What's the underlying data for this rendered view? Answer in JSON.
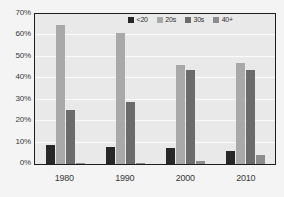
{
  "chart_data": {
    "type": "bar",
    "title": "",
    "subtitle": "",
    "xlabel": "",
    "ylabel": "",
    "categories": [
      "1980",
      "1990",
      "2000",
      "2010"
    ],
    "series": [
      {
        "name": "<20",
        "color": "#272727",
        "values": [
          9,
          8,
          7.5,
          6
        ]
      },
      {
        "name": "20s",
        "color": "#a9a9a9",
        "values": [
          65,
          61,
          46,
          47
        ]
      },
      {
        "name": "30s",
        "color": "#6b6b6b",
        "values": [
          25,
          29,
          44,
          44
        ]
      },
      {
        "name": "40+",
        "color": "#8d8d8d",
        "values": [
          0.5,
          0.5,
          1.5,
          4
        ]
      }
    ],
    "ylim": [
      0,
      70
    ],
    "yticks": [
      0,
      10,
      20,
      30,
      40,
      50,
      60,
      70
    ],
    "ytick_labels": [
      "0%",
      "10%",
      "20%",
      "30%",
      "40%",
      "50%",
      "60%",
      "70%"
    ],
    "grid": true,
    "legend_position": "top-right",
    "plot_background": "#e9e9e9",
    "figure_background": "#f4f4f4",
    "gridline_color": "#fbfbfb",
    "axis_color": "#1d1d1d"
  }
}
